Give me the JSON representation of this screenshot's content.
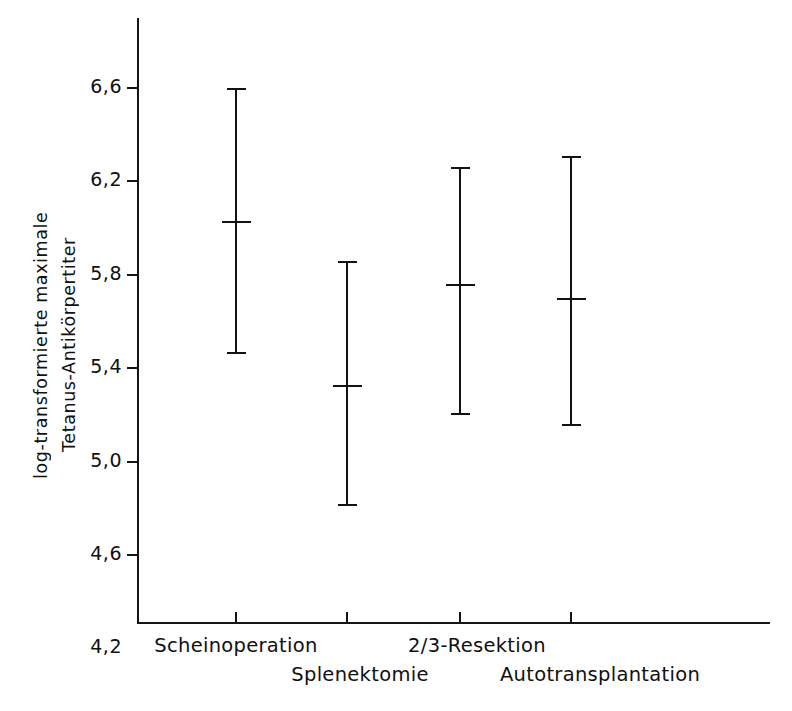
{
  "chart_data": {
    "type": "scatter",
    "subtype": "error-bar-plot",
    "title": "",
    "xlabel": "",
    "ylabel": "log-transformierte maximale Tetanus-Antikörpertiter",
    "ylabel_lines": [
      "log-transformierte maximale",
      "Tetanus-Antikörpertiter"
    ],
    "decimal_separator": ",",
    "ylim": [
      4.2,
      6.8
    ],
    "yticks": [
      6.6,
      6.2,
      5.8,
      5.4,
      5.0,
      4.6,
      4.2
    ],
    "ytick_labels": [
      "6,6",
      "6,2",
      "5,8",
      "5,4",
      "5,0",
      "4,6",
      "4,2"
    ],
    "grid": false,
    "legend": "none",
    "categories": [
      "Scheinoperation",
      "Splenektomie",
      "2/3-Resektion",
      "Autotransplantation"
    ],
    "points": [
      {
        "category": "Scheinoperation",
        "mean": 6.03,
        "lower": 5.47,
        "upper": 6.6
      },
      {
        "category": "Splenektomie",
        "mean": 5.33,
        "lower": 4.82,
        "upper": 5.86
      },
      {
        "category": "2/3-Resektion",
        "mean": 5.76,
        "lower": 5.21,
        "upper": 6.26
      },
      {
        "category": "Autotransplantation",
        "mean": 5.7,
        "lower": 5.16,
        "upper": 6.31
      }
    ],
    "series": [
      {
        "name": "log-transformierte maximale Tetanus-Antikörpertiter",
        "values": [
          6.03,
          5.33,
          5.76,
          5.7
        ],
        "lower": [
          5.47,
          4.82,
          5.21,
          5.16
        ],
        "upper": [
          6.6,
          5.86,
          6.26,
          6.31
        ]
      }
    ],
    "colors": {
      "line": "#121212",
      "axis": "#151515",
      "text": "#101010",
      "background": "#ffffff"
    }
  }
}
